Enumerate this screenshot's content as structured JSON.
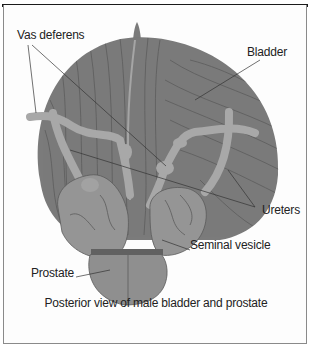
{
  "figure": {
    "caption": "Posterior view of male bladder and prostate",
    "labels": {
      "vas_deferens": "Vas deferens",
      "bladder": "Bladder",
      "ureters": "Ureters",
      "seminal_vesicle": "Seminal  vesicle",
      "prostate": "Prostate"
    },
    "colors": {
      "bladder": "#7b7b7b",
      "striation": "#555555",
      "tubes": "#a9a9a9",
      "vesicle": "#959595",
      "prostate": "#8f8f8f",
      "border": "#1a1a1a"
    }
  }
}
